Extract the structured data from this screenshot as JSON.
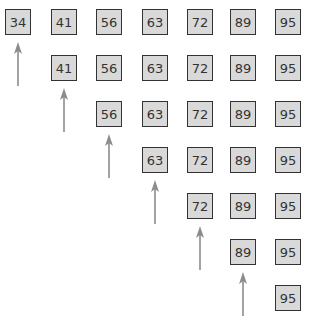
{
  "diagram": {
    "colors": {
      "box_fill": "#d9d9d9",
      "box_border": "#333333",
      "arrow": "#8c8c8c",
      "text": "#333333"
    },
    "rows": [
      {
        "start_col": 0,
        "values": [
          "34",
          "41",
          "56",
          "63",
          "72",
          "89",
          "95"
        ],
        "pointer_col": 0
      },
      {
        "start_col": 1,
        "values": [
          "41",
          "56",
          "63",
          "72",
          "89",
          "95"
        ],
        "pointer_col": 1
      },
      {
        "start_col": 2,
        "values": [
          "56",
          "63",
          "72",
          "89",
          "95"
        ],
        "pointer_col": 2
      },
      {
        "start_col": 3,
        "values": [
          "63",
          "72",
          "89",
          "95"
        ],
        "pointer_col": 3
      },
      {
        "start_col": 4,
        "values": [
          "72",
          "89",
          "95"
        ],
        "pointer_col": 4
      },
      {
        "start_col": 5,
        "values": [
          "89",
          "95"
        ],
        "pointer_col": 5
      },
      {
        "start_col": 6,
        "values": [
          "95"
        ],
        "pointer_col": null
      }
    ]
  }
}
